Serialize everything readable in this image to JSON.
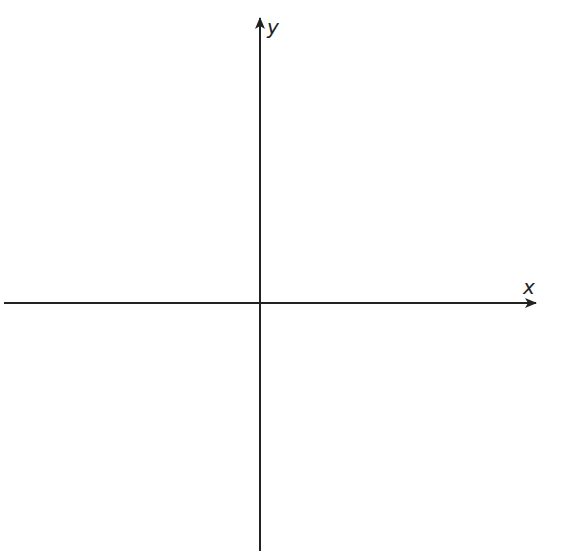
{
  "diagram": {
    "type": "cartesian-axes",
    "x_axis": {
      "label": "x",
      "direction": "right",
      "arrow": true
    },
    "y_axis": {
      "label": "y",
      "direction": "up",
      "arrow": true
    },
    "origin": "center-crossing",
    "colors": {
      "axis": "#222222",
      "background": "#ffffff"
    }
  }
}
